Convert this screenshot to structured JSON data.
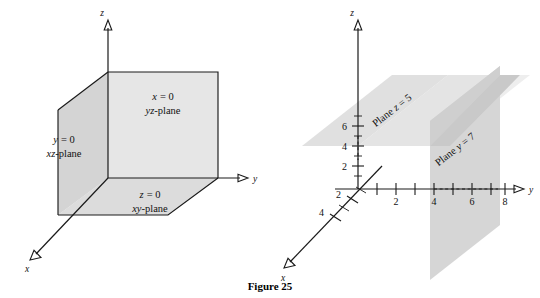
{
  "figure": {
    "caption": "Figure 25",
    "background_color": "#ffffff",
    "line_color": "#1a1a1a",
    "plane_fill_light": "#e8e8e8",
    "plane_fill_mid": "#dcdcdc",
    "plane_fill_dark": "#d0d0d0"
  },
  "left_diagram": {
    "name": "coordinate-planes",
    "axes": [
      {
        "id": "x",
        "label": "x"
      },
      {
        "id": "y",
        "label": "y"
      },
      {
        "id": "z",
        "label": "z"
      }
    ],
    "planes": [
      {
        "id": "yz",
        "equation": "x = 0",
        "eq_var": "x",
        "eq_rhs": "= 0",
        "name_prefix": "yz",
        "name_suffix": "-plane"
      },
      {
        "id": "xz",
        "equation": "y = 0",
        "eq_var": "y",
        "eq_rhs": "= 0",
        "name_prefix": "xz",
        "name_suffix": "-plane"
      },
      {
        "id": "xy",
        "equation": "z = 0",
        "eq_var": "z",
        "eq_rhs": "= 0",
        "name_prefix": "xy",
        "name_suffix": "-plane"
      }
    ]
  },
  "right_diagram": {
    "name": "parallel-planes",
    "axes": [
      {
        "id": "x",
        "label": "x"
      },
      {
        "id": "y",
        "label": "y"
      },
      {
        "id": "z",
        "label": "z"
      }
    ],
    "y_axis_ticks": [
      "2",
      "4",
      "6",
      "8"
    ],
    "z_axis_ticks": [
      "2",
      "4",
      "6"
    ],
    "x_axis_ticks": [
      "2",
      "4"
    ],
    "planes": [
      {
        "id": "z5",
        "label_prefix": "Plane ",
        "label_var": "z",
        "label_rhs": " = 5",
        "value": 5,
        "orientation": "horizontal"
      },
      {
        "id": "y7",
        "label_prefix": "Plane ",
        "label_var": "y",
        "label_rhs": " = 7",
        "value": 7,
        "orientation": "vertical"
      }
    ]
  }
}
